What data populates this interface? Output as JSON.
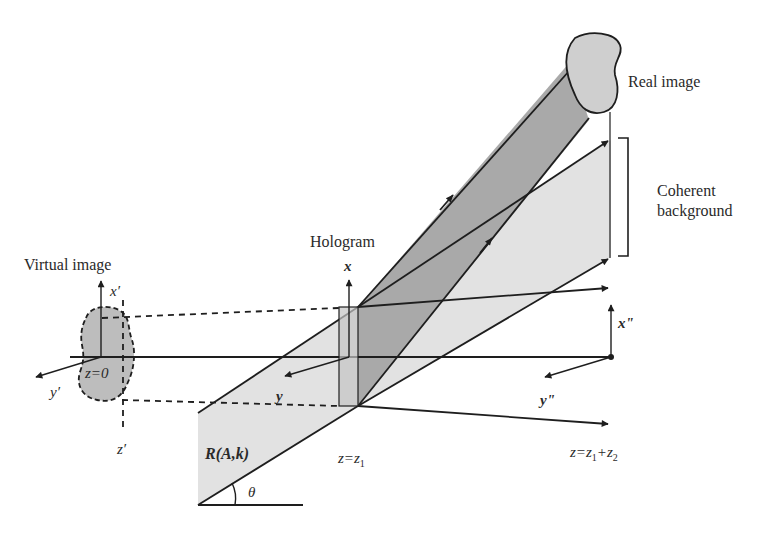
{
  "diagram": {
    "type": "optical holography reconstruction schematic",
    "labels": {
      "virtual_image": "Virtual image",
      "hologram": "Hologram",
      "real_image": "Real image",
      "coherent_background_line1": "Coherent",
      "coherent_background_line2": "background",
      "reference_wave": "R(A,k)",
      "angle": "θ"
    },
    "axes": {
      "virtual": {
        "x": "x′",
        "y": "y′",
        "z": "z′",
        "origin": "z=0"
      },
      "hologram": {
        "x": "x",
        "y": "y",
        "position": "z=z",
        "position_sub": "1"
      },
      "image": {
        "x": "x\"",
        "y": "y\"",
        "position_a": "z=z",
        "sub_a": "1",
        "position_b": "+z",
        "sub_b": "2"
      }
    },
    "colors": {
      "light_fill": "#e2e2e2",
      "dark_fill": "#a9a9a9",
      "object_fill": "#cfcfcf",
      "stroke": "#1e1e1e"
    }
  }
}
